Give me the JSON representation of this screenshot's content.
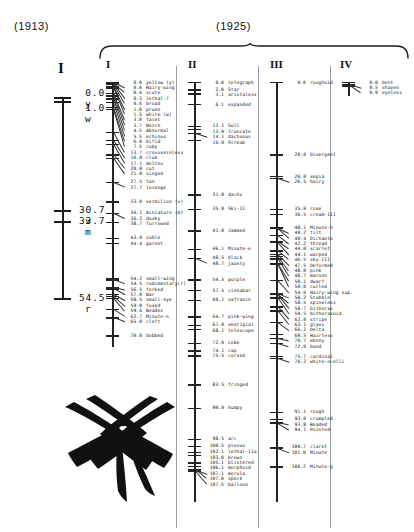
{
  "figure": {
    "label_1913": "(1913)",
    "label_1925": "(1925)"
  },
  "map_1913": {
    "title": "I",
    "entries": [
      {
        "pos": "0.0",
        "name": "y"
      },
      {
        "pos": "1.0",
        "name": "w"
      },
      {
        "pos": "30.7",
        "name": "v"
      },
      {
        "pos": "33.7",
        "name": "m"
      },
      {
        "pos": "54.5",
        "name": "r"
      }
    ]
  },
  "chart_data": {
    "type": "table",
    "xlabel": "",
    "ylabel": "map position (centimorgans)",
    "grid": false,
    "legend": "none",
    "axis_range_1913": [
      0.0,
      54.5
    ],
    "axis_range_1925": [
      0.0,
      107.5
    ],
    "maps": [
      {
        "name": "I",
        "values": [
          0.0,
          0.0,
          0.4,
          0.3,
          0.6,
          1.0,
          1.5,
          3.0,
          3.7,
          4.5,
          5.5,
          6.9,
          7.5,
          13.7,
          16.0,
          17.1,
          20.0,
          21.0,
          27.5,
          27.7,
          33.0,
          36.1,
          36.2,
          38.7,
          43.0,
          44.4,
          54.2,
          54.5,
          56.5,
          57.0,
          58.5,
          59.0,
          59.6,
          62.7,
          65.0,
          70.0
        ],
        "categories": [
          "yellow  (y)",
          "Hairy-wing",
          "scute",
          "lethal-7",
          "broad",
          "prune",
          "white  (w)",
          "facet",
          "Notch",
          "Abnormal",
          "echinus",
          "bifid",
          "ruby",
          "crossveinless",
          "club",
          "deltex",
          "cut",
          "singed",
          "tan",
          "lozenge",
          "vermilion (v)",
          "miniature (m)",
          "dusky",
          "furrowed",
          "sable",
          "garnet",
          "small-wing",
          "rudimentary(r)",
          "forked",
          "Bar",
          "small-eye",
          "fused",
          "Beadex",
          "Minute-n",
          "cleft",
          "bobbed"
        ]
      },
      {
        "name": "II",
        "values": [
          0.0,
          2.0,
          3.1,
          6.1,
          12.1,
          13.0,
          14.1,
          16.0,
          31.0,
          35.0,
          41.0,
          46.1,
          48.5,
          48.7,
          54.5,
          57.5,
          60.1,
          64.7,
          67.0,
          68.1,
          72.0,
          74.1,
          75.5,
          83.5,
          90.0,
          98.5,
          100.5,
          102.1,
          103.0,
          105.1,
          106.1,
          107.0,
          107.1,
          107.5
        ],
        "categories": [
          "telegraph",
          "Star",
          "aristaless",
          "expanded",
          "Gull",
          "Truncate",
          "dachsous",
          "Streak",
          "dachs",
          "Ski-II",
          "Jammed",
          "Minute-e",
          "black",
          "jaunty",
          "purple",
          "cinnabar",
          "safranin",
          "pink-wing",
          "vestigial",
          "telescope",
          "Lobe",
          "cap",
          "curved",
          "fringed",
          "humpy",
          "arc",
          "plexus",
          "lethal-IIa",
          "brown",
          "blistered",
          "morphoid",
          "morula",
          "speck",
          "balloon"
        ]
      },
      {
        "name": "III",
        "values": [
          0.0,
          20.0,
          26.0,
          26.5,
          35.0,
          36.5,
          40.1,
          40.2,
          40.4,
          42.2,
          44.0,
          44.1,
          46.5,
          47.5,
          48.0,
          48.7,
          50.1,
          50.0,
          54.6,
          58.2,
          58.5,
          58.7,
          59.5,
          62.0,
          63.1,
          66.2,
          69.5,
          70.7,
          72.0,
          75.7,
          76.2,
          91.1,
          93.0,
          93.8,
          94.1,
          100.7,
          101.0,
          106.2
        ],
        "categories": [
          "roughoid",
          "Divergent",
          "sepia",
          "hairy",
          "rose",
          "cream-III",
          "Minute-h",
          "tilt",
          "Dichaete",
          "thread",
          "scarlet",
          "warped",
          "sky-III",
          "Deformed",
          "pink",
          "maroon",
          "dwarf",
          "curled",
          "Hairy-wing sup.",
          "Stubble",
          "spineless",
          "bithorax",
          "bithoraxoid",
          "stripe",
          "glass",
          "Delta",
          "Hairless",
          "ebony",
          "band",
          "cardinal",
          "white-ocelli",
          "rough",
          "crumpled",
          "Beaded",
          "Pointed",
          "claret",
          "Minute",
          "Minute-g"
        ]
      },
      {
        "name": "IV",
        "values": [
          0.0,
          0.5,
          0.9
        ],
        "categories": [
          "bent",
          "shaven",
          "eyeless"
        ]
      }
    ]
  },
  "map_1925": {
    "columns": [
      {
        "title": "I",
        "entries": [
          {
            "pos": "0.0",
            "name": "yellow  (y)"
          },
          {
            "pos": "0.0",
            "name": "Hairy-wing"
          },
          {
            "pos": "0.4",
            "name": "scute"
          },
          {
            "pos": "0.3",
            "name": "lethal-7"
          },
          {
            "pos": "0.6",
            "name": "broad"
          },
          {
            "pos": "1.0",
            "name": "prune"
          },
          {
            "pos": "1.5",
            "name": "white  (w)"
          },
          {
            "pos": "3.0",
            "name": "facet"
          },
          {
            "pos": "3.7",
            "name": "Notch"
          },
          {
            "pos": "4.5",
            "name": "Abnormal"
          },
          {
            "pos": "5.5",
            "name": "echinus"
          },
          {
            "pos": "6.9",
            "name": "bifid"
          },
          {
            "pos": "7.5",
            "name": "ruby"
          },
          {
            "pos": "13.7",
            "name": "crossveinless"
          },
          {
            "pos": "16.0",
            "name": "club"
          },
          {
            "pos": "17.1",
            "name": "deltex"
          },
          {
            "pos": "20.0",
            "name": "cut"
          },
          {
            "pos": "21.0",
            "name": "singed"
          },
          {
            "pos": "27.5",
            "name": "tan"
          },
          {
            "pos": "27.7",
            "name": "lozenge"
          },
          {
            "pos": "33.0",
            "name": "vermilion (v)"
          },
          {
            "pos": "36.1",
            "name": "miniature (m)"
          },
          {
            "pos": "36.2",
            "name": "dusky"
          },
          {
            "pos": "38.7",
            "name": "furrowed"
          },
          {
            "pos": "43.0",
            "name": "sable"
          },
          {
            "pos": "44.4",
            "name": "garnet"
          },
          {
            "pos": "54.2",
            "name": "small-wing"
          },
          {
            "pos": "54.5",
            "name": "rudimentary(r)"
          },
          {
            "pos": "56.5",
            "name": "forked"
          },
          {
            "pos": "57.0",
            "name": "Bar"
          },
          {
            "pos": "58.5",
            "name": "small-eye"
          },
          {
            "pos": "59.0",
            "name": "fused"
          },
          {
            "pos": "59.6",
            "name": "Beadex"
          },
          {
            "pos": "62.7",
            "name": "Minute-n"
          },
          {
            "pos": "65.0",
            "name": "cleft"
          },
          {
            "pos": "70.0",
            "name": "bobbed"
          }
        ]
      },
      {
        "title": "II",
        "entries": [
          {
            "pos": "0.0",
            "name": "telegraph"
          },
          {
            "pos": "2.0",
            "name": "Star"
          },
          {
            "pos": "3.1",
            "name": "aristaless"
          },
          {
            "pos": "6.1",
            "name": "expanded"
          },
          {
            "pos": "12.1",
            "name": "Gull"
          },
          {
            "pos": "13.0",
            "name": "Truncate"
          },
          {
            "pos": "14.1",
            "name": "dachsous"
          },
          {
            "pos": "16.0",
            "name": "Streak"
          },
          {
            "pos": "31.0",
            "name": "dachs"
          },
          {
            "pos": "35.0",
            "name": "Ski-II"
          },
          {
            "pos": "41.0",
            "name": "Jammed"
          },
          {
            "pos": "46.1",
            "name": "Minute-e"
          },
          {
            "pos": "48.5",
            "name": "black"
          },
          {
            "pos": "48.7",
            "name": "jaunty"
          },
          {
            "pos": "54.5",
            "name": "purple"
          },
          {
            "pos": "57.5",
            "name": "cinnabar"
          },
          {
            "pos": "60.1",
            "name": "safranin"
          },
          {
            "pos": "64.7",
            "name": "pink-wing"
          },
          {
            "pos": "67.0",
            "name": "vestigial"
          },
          {
            "pos": "68.1",
            "name": "telescope"
          },
          {
            "pos": "72.0",
            "name": "Lobe"
          },
          {
            "pos": "74.1",
            "name": "cap"
          },
          {
            "pos": "75.5",
            "name": "curved"
          },
          {
            "pos": "83.5",
            "name": "fringed"
          },
          {
            "pos": "90.0",
            "name": "humpy"
          },
          {
            "pos": "98.5",
            "name": "arc"
          },
          {
            "pos": "100.5",
            "name": "plexus"
          },
          {
            "pos": "102.1",
            "name": "lethal-IIa"
          },
          {
            "pos": "103.0",
            "name": "brown"
          },
          {
            "pos": "105.1",
            "name": "blistered"
          },
          {
            "pos": "106.1",
            "name": "morphoid"
          },
          {
            "pos": "107.1",
            "name": "morula"
          },
          {
            "pos": "107.0",
            "name": "speck"
          },
          {
            "pos": "107.5",
            "name": "balloon"
          }
        ]
      },
      {
        "title": "III",
        "entries": [
          {
            "pos": "0.0",
            "name": "roughoid"
          },
          {
            "pos": "20.0",
            "name": "Divergent"
          },
          {
            "pos": "26.0",
            "name": "sepia"
          },
          {
            "pos": "26.5",
            "name": "hairy"
          },
          {
            "pos": "35.0",
            "name": "rose"
          },
          {
            "pos": "36.5",
            "name": "cream-III"
          },
          {
            "pos": "40.1",
            "name": "Minute-h"
          },
          {
            "pos": "40.2",
            "name": "tilt"
          },
          {
            "pos": "40.4",
            "name": "Dichaete"
          },
          {
            "pos": "42.2",
            "name": "thread"
          },
          {
            "pos": "44.0",
            "name": "scarlet"
          },
          {
            "pos": "44.1",
            "name": "warped"
          },
          {
            "pos": "46.5",
            "name": "sky-III"
          },
          {
            "pos": "47.5",
            "name": "Deformed"
          },
          {
            "pos": "48.0",
            "name": "pink"
          },
          {
            "pos": "48.7",
            "name": "maroon"
          },
          {
            "pos": "50.1",
            "name": "dwarf"
          },
          {
            "pos": "50.0",
            "name": "curled"
          },
          {
            "pos": "54.6",
            "name": "Hairy-wing sup."
          },
          {
            "pos": "58.2",
            "name": "Stubble"
          },
          {
            "pos": "58.5",
            "name": "spineless"
          },
          {
            "pos": "58.7",
            "name": "bithorax"
          },
          {
            "pos": "59.5",
            "name": "bithoraxoid"
          },
          {
            "pos": "62.0",
            "name": "stripe"
          },
          {
            "pos": "63.1",
            "name": "glass"
          },
          {
            "pos": "66.2",
            "name": "Delta"
          },
          {
            "pos": "69.5",
            "name": "Hairless"
          },
          {
            "pos": "70.7",
            "name": "ebony"
          },
          {
            "pos": "72.0",
            "name": "band"
          },
          {
            "pos": "75.7",
            "name": "cardinal"
          },
          {
            "pos": "76.2",
            "name": "white-ocelli"
          },
          {
            "pos": "91.1",
            "name": "rough"
          },
          {
            "pos": "93.0",
            "name": "crumpled"
          },
          {
            "pos": "93.8",
            "name": "Beaded"
          },
          {
            "pos": "94.1",
            "name": "Pointed"
          },
          {
            "pos": "100.7",
            "name": "claret"
          },
          {
            "pos": "101.0",
            "name": "Minute"
          },
          {
            "pos": "106.2",
            "name": "Minute-g"
          }
        ]
      },
      {
        "title": "IV",
        "entries": [
          {
            "pos": "0.0",
            "name": "bent"
          },
          {
            "pos": "0.5",
            "name": "shaven"
          },
          {
            "pos": "0.9",
            "name": "eyeless"
          }
        ]
      }
    ]
  }
}
